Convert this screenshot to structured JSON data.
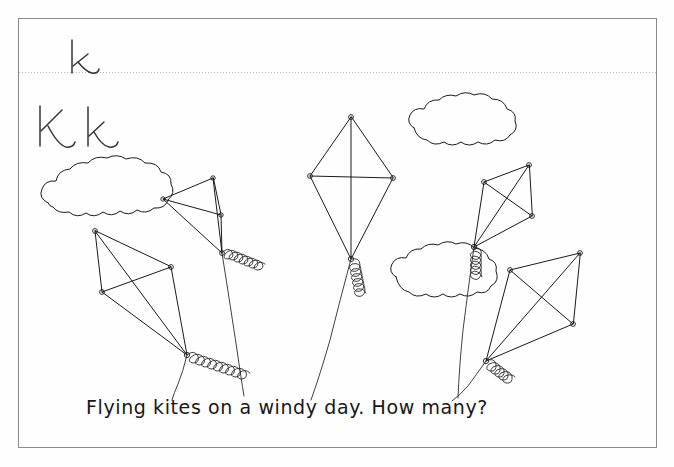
{
  "worksheet": {
    "title": "Letter K handwriting and kite counting worksheet",
    "background_color": "#fefefe",
    "ink_color": "#1a1a1a",
    "border_color": "#8a8a8a",
    "guideline_color": "#b9b9b9",
    "border": {
      "x": 18,
      "y": 18,
      "width": 639,
      "height": 430
    },
    "guideline": {
      "y": 72,
      "style": "dotted",
      "x_start": 19,
      "x_end": 656
    }
  },
  "letters": {
    "practice_row": {
      "label": "k",
      "x": 72,
      "y": 72,
      "description": "lowercase k written on the dotted guideline"
    },
    "model_row": {
      "label": "K k",
      "uppercase": "K",
      "lowercase": "k",
      "x": 38,
      "y": 138,
      "description": "uppercase K and lowercase k letter pair model"
    }
  },
  "caption": {
    "text": "Flying   kites  on  a  windy   day. How  many?",
    "words": [
      "Flying",
      "kites",
      "on",
      "a",
      "windy",
      "day.",
      "How",
      "many?"
    ],
    "x": 86,
    "y": 413,
    "font_size": 19
  },
  "scene": {
    "kite_count": 5,
    "cloud_count": 3,
    "kites": [
      {
        "name": "kite-upper-left",
        "top": [
          213,
          178
        ],
        "left": [
          163,
          199
        ],
        "right": [
          221,
          215
        ],
        "bottom": [
          222,
          253
        ],
        "tail_start": [
          222,
          253
        ],
        "tail_end": [
          300,
          274
        ],
        "tail_loops": 7,
        "string_end": [
          244,
          392
        ]
      },
      {
        "name": "kite-lower-left",
        "top": [
          95,
          231
        ],
        "left": [
          102,
          292
        ],
        "right": [
          171,
          267
        ],
        "bottom": [
          187,
          355
        ],
        "tail_start": [
          187,
          355
        ],
        "tail_end": [
          293,
          372
        ],
        "tail_loops": 9,
        "string_end": [
          172,
          400
        ]
      },
      {
        "name": "kite-center",
        "top": [
          351,
          117
        ],
        "left": [
          310,
          176
        ],
        "right": [
          393,
          178
        ],
        "bottom": [
          351,
          259
        ],
        "tail_start": [
          351,
          259
        ],
        "tail_end": [
          404,
          308
        ],
        "tail_loops": 6,
        "string_end": [
          311,
          400
        ]
      },
      {
        "name": "kite-upper-right",
        "top": [
          529,
          165
        ],
        "left": [
          484,
          182
        ],
        "right": [
          532,
          216
        ],
        "bottom": [
          474,
          247
        ],
        "tail_start": [
          474,
          247
        ],
        "tail_end": [
          500,
          292
        ],
        "tail_loops": 5,
        "string_end": [
          458,
          395
        ]
      },
      {
        "name": "kite-lower-right",
        "top": [
          580,
          253
        ],
        "left": [
          510,
          270
        ],
        "right": [
          573,
          324
        ],
        "bottom": [
          486,
          361
        ],
        "tail_start": [
          486,
          361
        ],
        "tail_end": [
          530,
          385
        ],
        "tail_loops": 5,
        "string_end": [
          452,
          400
        ]
      }
    ],
    "clouds": [
      {
        "name": "cloud-left",
        "cx": 107,
        "cy": 198,
        "rx": 62,
        "ry": 25
      },
      {
        "name": "cloud-top-right",
        "cx": 469,
        "cy": 122,
        "rx": 56,
        "ry": 22
      },
      {
        "name": "cloud-center",
        "cx": 446,
        "cy": 272,
        "rx": 53,
        "ry": 26
      }
    ]
  },
  "icons": {
    "kite": "kite-icon",
    "cloud": "cloud-icon",
    "tail": "kite-tail-icon"
  }
}
